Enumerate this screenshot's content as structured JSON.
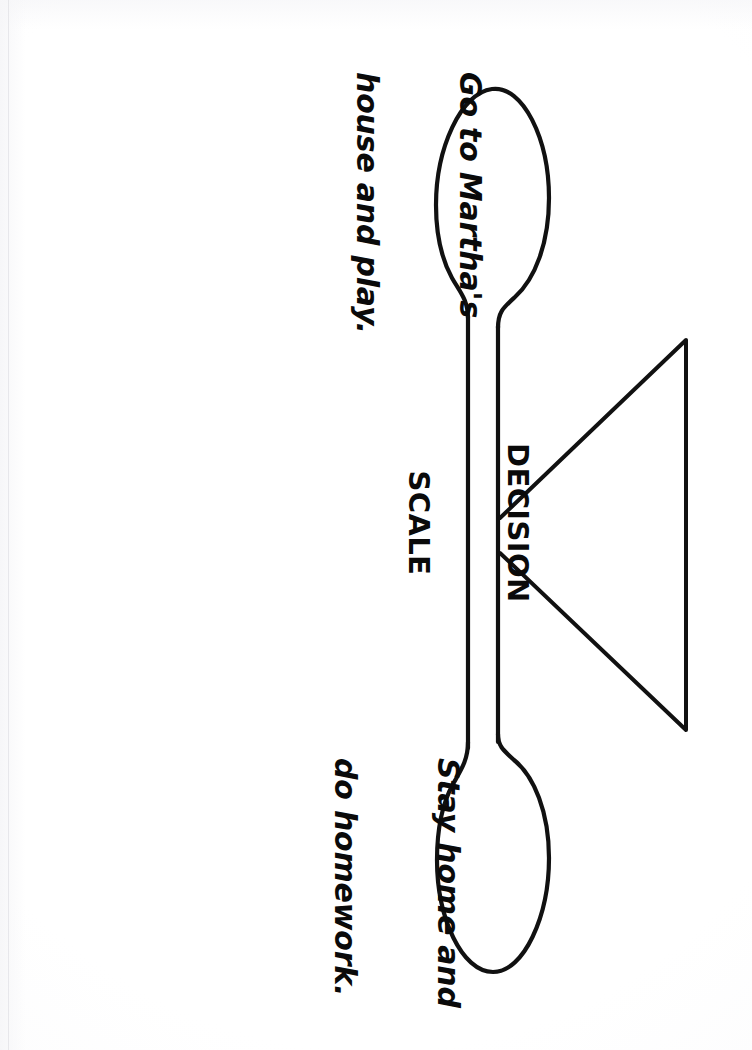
{
  "document": {
    "title": "Decision Scale",
    "orientation": "landscape-scan-of-portrait-page",
    "background_color": "#fdfdfd",
    "ink_color": "#0a0a0a"
  },
  "diagram": {
    "name": "decision-scale",
    "type": "balance-scale",
    "fulcrum": {
      "label_lines": [
        "DECISION",
        "SCALE"
      ],
      "shape": "triangle"
    },
    "pans": [
      {
        "id": "pan-upper",
        "position": "top",
        "label_lines": [
          "Go to Martha's",
          "house and play."
        ]
      },
      {
        "id": "pan-lower",
        "position": "bottom",
        "label_lines": [
          "Stay home and",
          "do homework."
        ]
      }
    ],
    "beam": {
      "name": "balance-beam",
      "orientation": "vertical-in-scan"
    }
  }
}
